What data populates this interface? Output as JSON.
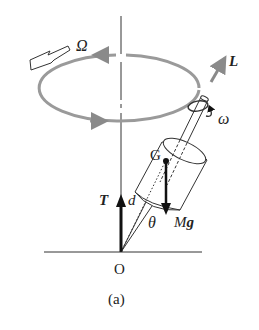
{
  "figure": {
    "caption": "(a)",
    "labels": {
      "precession": "Ω",
      "angular_momentum": "L",
      "spin": "ω",
      "center_of_mass": "G",
      "distance": "d",
      "tension": "T",
      "angle": "θ",
      "weight_M": "M",
      "weight_g": "g",
      "origin": "O"
    },
    "colors": {
      "ink": "#222222",
      "gray_arrow": "#8a8a8a",
      "orbit": "#9a9a9a"
    }
  }
}
